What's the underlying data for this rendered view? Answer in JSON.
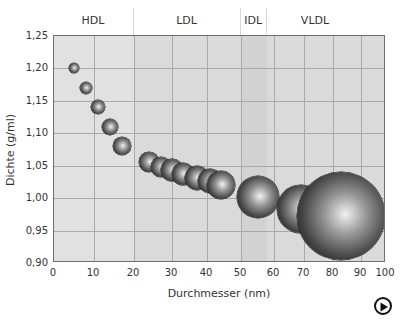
{
  "chart_data": {
    "type": "scatter",
    "subtype": "bubble",
    "title": "",
    "xlabel": "Durchmesser (nm)",
    "ylabel": "Dichte (g/ml)",
    "xlim": [
      0,
      100
    ],
    "ylim": [
      0.9,
      1.25
    ],
    "x_scale": "non-linear (compressed toward high values)",
    "x_ticks": [
      "0",
      "10",
      "20",
      "30",
      "40",
      "50",
      "60",
      "70",
      "80",
      "90",
      "100"
    ],
    "y_ticks": [
      "0,90",
      "0,95",
      "1,00",
      "1,05",
      "1,10",
      "1,15",
      "1,20",
      "1,25"
    ],
    "grid": true,
    "legend": null,
    "bands": [
      {
        "label": "HDL",
        "x_range": [
          0,
          20
        ]
      },
      {
        "label": "LDL",
        "x_range": [
          20,
          50
        ]
      },
      {
        "label": "IDL",
        "x_range": [
          50,
          58
        ]
      },
      {
        "label": "VLDL",
        "x_range": [
          58,
          100
        ]
      }
    ],
    "points": [
      {
        "x": 5,
        "y": 1.2,
        "r": 5
      },
      {
        "x": 8,
        "y": 1.17,
        "r": 6
      },
      {
        "x": 11,
        "y": 1.14,
        "r": 7
      },
      {
        "x": 14,
        "y": 1.11,
        "r": 8
      },
      {
        "x": 17,
        "y": 1.08,
        "r": 9
      },
      {
        "x": 24,
        "y": 1.055,
        "r": 10
      },
      {
        "x": 27,
        "y": 1.048,
        "r": 10
      },
      {
        "x": 30,
        "y": 1.043,
        "r": 11
      },
      {
        "x": 33,
        "y": 1.037,
        "r": 11
      },
      {
        "x": 37,
        "y": 1.031,
        "r": 12
      },
      {
        "x": 41,
        "y": 1.027,
        "r": 12
      },
      {
        "x": 44,
        "y": 1.021,
        "r": 14
      },
      {
        "x": 55,
        "y": 1.002,
        "r": 21
      },
      {
        "x": 69,
        "y": 0.983,
        "r": 24
      },
      {
        "x": 83,
        "y": 0.972,
        "r": 44
      }
    ]
  },
  "ui": {
    "play_button": "play-icon"
  }
}
